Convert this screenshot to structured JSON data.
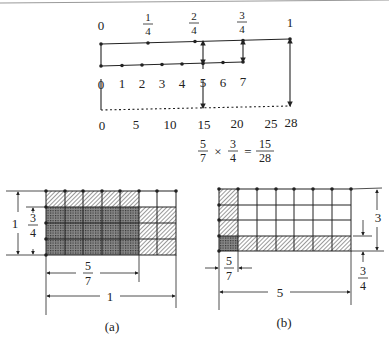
{
  "number_lines": {
    "quarters": {
      "labels": [
        "0",
        "1/4",
        "2/4",
        "3/4",
        "1"
      ]
    },
    "sevenths": {
      "labels": [
        "0",
        "1",
        "2",
        "3",
        "4",
        "5",
        "6",
        "7"
      ]
    },
    "twentyeighths": {
      "labels": [
        "0",
        "5",
        "10",
        "15",
        "20",
        "25",
        "28"
      ]
    }
  },
  "equation": {
    "a_num": "5",
    "a_den": "7",
    "times": "×",
    "b_num": "3",
    "b_den": "4",
    "eq": "=",
    "r_num": "15",
    "r_den": "28"
  },
  "figure_a": {
    "caption": "(a)",
    "height_label": "1",
    "three_quarters": {
      "num": "3",
      "den": "4"
    },
    "five_sevenths": {
      "num": "5",
      "den": "7"
    },
    "width_label": "1"
  },
  "figure_b": {
    "caption": "(b)",
    "height_label": "3",
    "three_quarters": {
      "num": "3",
      "den": "4"
    },
    "five_sevenths": {
      "num": "5",
      "den": "7"
    },
    "width_label": "5"
  },
  "colors": {
    "ink": "#222222",
    "background": "#ffffff"
  }
}
